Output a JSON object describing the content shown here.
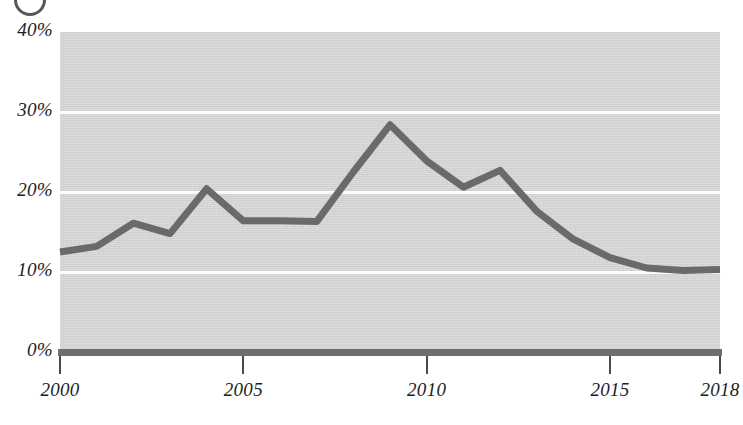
{
  "figure": {
    "badge_icon": "circle-marker-icon",
    "badge_label": "",
    "background_color": "#d3d3d3",
    "gridline_color": "#ffffff",
    "axis_color": "#6e6e6e",
    "line_color": "#6a6a6a"
  },
  "chart_data": {
    "type": "line",
    "title": "",
    "subtitle": "",
    "xlabel": "",
    "ylabel": "",
    "grid": true,
    "legend_position": "none",
    "xlim": [
      2000,
      2018
    ],
    "ylim": [
      0,
      40
    ],
    "x_tick_labels": [
      "2000",
      "2005",
      "2010",
      "2015",
      "2018"
    ],
    "x_tick_values": [
      2000,
      2005,
      2010,
      2015,
      2018
    ],
    "y_tick_labels": [
      "0%",
      "10%",
      "20%",
      "30%",
      "40%"
    ],
    "y_tick_values": [
      0,
      10,
      20,
      30,
      40
    ],
    "x": [
      2000,
      2001,
      2002,
      2003,
      2004,
      2005,
      2006,
      2007,
      2008,
      2009,
      2010,
      2011,
      2012,
      2013,
      2014,
      2015,
      2016,
      2017,
      2018
    ],
    "series": [
      {
        "name": "share",
        "values": [
          12.5,
          13.2,
          16.1,
          14.8,
          20.4,
          16.4,
          16.4,
          16.3,
          22.5,
          28.4,
          23.9,
          20.6,
          22.7,
          17.6,
          14.1,
          11.8,
          10.5,
          10.2,
          10.3
        ]
      }
    ],
    "value_labels": [
      "12.5%",
      "13.2%",
      "16.1%",
      "14.8%",
      "20.4%",
      "16.4%",
      "16.4%",
      "16.3%",
      "22.5%",
      "28.4%",
      "23.9%",
      "20.6%",
      "22.7%",
      "17.6%",
      "14.1%",
      "11.8%",
      "10.5%",
      "10.2%",
      "10.3%"
    ]
  }
}
